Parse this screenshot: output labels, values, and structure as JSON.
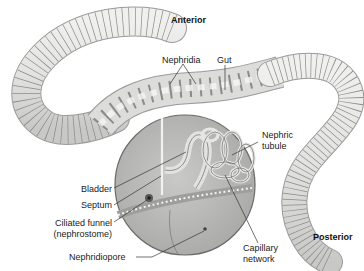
{
  "diagram": {
    "orientation_labels": {
      "anterior": "Anterior",
      "posterior": "Posterior"
    },
    "labels": {
      "nephridia": "Nephridia",
      "gut": "Gut",
      "nephric_tubule_line1": "Nephric",
      "nephric_tubule_line2": "tubule",
      "bladder": "Bladder",
      "septum": "Septum",
      "ciliated_funnel_line1": "Ciliated funnel",
      "ciliated_funnel_line2": "(nephrostome)",
      "nephridiopore": "Nephridiopore",
      "capillary_line1": "Capillary",
      "capillary_line2": "network"
    },
    "colors": {
      "worm_body": "#e4e4e2",
      "worm_segment_line": "#8a8a88",
      "worm_outline": "#9a9a98",
      "cutaway_fill": "#b9b9b7",
      "cutaway_outline": "#6a6a68",
      "tubule": "#d8d8d6",
      "leader_line": "#333333",
      "text": "#222222"
    }
  }
}
